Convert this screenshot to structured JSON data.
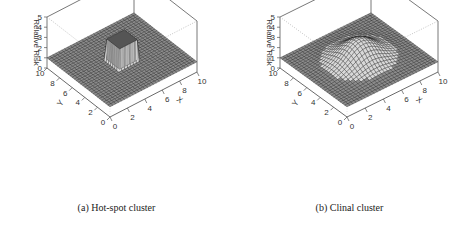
{
  "chart_data": [
    {
      "type": "surface3d",
      "panel": "a",
      "caption": "(a) Hot-spot cluster",
      "surface": "hotspot",
      "description": "Flat surface at relative risk 1 with a square column (hot spot) rising to ~3 near the center",
      "xlabel": "X",
      "ylabel": "Y",
      "zlabel": "Relative Risk",
      "x_ticks": [
        "0",
        "2",
        "4",
        "6",
        "8",
        "10"
      ],
      "y_ticks": [
        "0",
        "2",
        "4",
        "6",
        "8",
        "10"
      ],
      "z_ticks": [
        "0",
        "1",
        "2",
        "3",
        "4",
        "5"
      ],
      "xlim": [
        0,
        10
      ],
      "ylim": [
        0,
        10
      ],
      "zlim": [
        0,
        5
      ],
      "baseline": 1,
      "peak": 3,
      "hotspot_region": {
        "x": [
          4,
          6
        ],
        "y": [
          4,
          6
        ]
      }
    },
    {
      "type": "surface3d",
      "panel": "b",
      "caption": "(b) Clinal cluster",
      "surface": "clinal",
      "description": "Smooth Gaussian bump centered at (5,5) rising from baseline 1 to a peak of ~3",
      "xlabel": "X",
      "ylabel": "Y",
      "zlabel": "Relative Risk",
      "x_ticks": [
        "0",
        "2",
        "4",
        "6",
        "8",
        "10"
      ],
      "y_ticks": [
        "0",
        "2",
        "4",
        "6",
        "8",
        "10"
      ],
      "z_ticks": [
        "0",
        "1",
        "2",
        "3",
        "4",
        "5"
      ],
      "xlim": [
        0,
        10
      ],
      "ylim": [
        0,
        10
      ],
      "zlim": [
        0,
        5
      ],
      "baseline": 1,
      "peak": 3,
      "center": [
        5,
        5
      ],
      "sigma": 1.6
    }
  ],
  "captions": {
    "a": "(a) Hot-spot cluster",
    "b": "(b) Clinal cluster"
  }
}
